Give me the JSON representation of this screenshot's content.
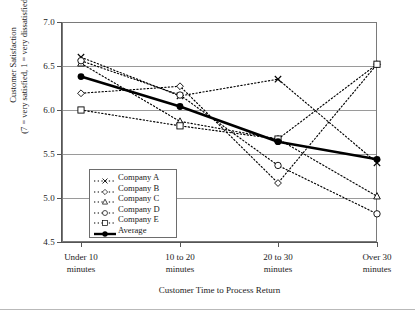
{
  "chart_data": {
    "type": "line",
    "title": "",
    "xlabel": "Customer Time to Process Return",
    "ylabel": "Customer Satisfaction\n(7 = very satisfied, 1 = very dissatisfied)",
    "ylabel_line1": "Customer Satisfaction",
    "ylabel_line2": "(7 = very satisfied, 1 = very dissatisfied)",
    "categories": [
      "Under 10 minutes",
      "10 to 20 minutes",
      "20 to 30 minutes",
      "Over 30 minutes"
    ],
    "category_lines": [
      [
        "Under 10",
        "minutes"
      ],
      [
        "10 to 20",
        "minutes"
      ],
      [
        "20 to 30",
        "minutes"
      ],
      [
        "Over 30",
        "minutes"
      ]
    ],
    "ylim": [
      4.5,
      7.0
    ],
    "yticks": [
      "7.0",
      "6.5",
      "6.0",
      "5.5",
      "5.0",
      "4.5"
    ],
    "ytick_values": [
      7.0,
      6.5,
      6.0,
      5.5,
      5.0,
      4.5
    ],
    "grid": true,
    "legend_position": "inside-lower-left",
    "series": [
      {
        "name": "Company A",
        "marker": "x",
        "style": "dotted",
        "values": [
          6.6,
          6.16,
          6.35,
          5.4
        ]
      },
      {
        "name": "Company B",
        "marker": "diamond",
        "style": "dotted",
        "values": [
          6.19,
          6.27,
          5.17,
          6.52
        ]
      },
      {
        "name": "Company C",
        "marker": "triangle",
        "style": "dotted",
        "values": [
          6.53,
          5.87,
          5.67,
          5.02
        ]
      },
      {
        "name": "Company D",
        "marker": "circle",
        "style": "dotted",
        "values": [
          6.56,
          6.17,
          5.37,
          4.82
        ]
      },
      {
        "name": "Company E",
        "marker": "square",
        "style": "dotted",
        "values": [
          6.0,
          5.82,
          5.67,
          6.52
        ]
      },
      {
        "name": "Average",
        "marker": "filled-circle",
        "style": "solid-bold",
        "values": [
          6.38,
          6.04,
          5.64,
          5.44
        ]
      }
    ]
  },
  "legend": {
    "items": [
      {
        "label": "Company A"
      },
      {
        "label": "Company B"
      },
      {
        "label": "Company C"
      },
      {
        "label": "Company D"
      },
      {
        "label": "Company E"
      },
      {
        "label": "Average"
      }
    ]
  },
  "colors": {
    "series": "#000000",
    "grid": "#9a9a9a",
    "axis": "#555555",
    "frame": "#7a7a7a",
    "background": "#ffffff"
  }
}
